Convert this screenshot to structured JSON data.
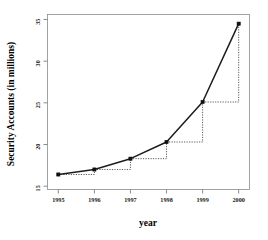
{
  "chart_data": {
    "type": "line",
    "title": "",
    "xlabel": "year",
    "ylabel": "Security Accounts (in millions)",
    "x": [
      1995,
      1996,
      1997,
      1998,
      1999,
      2000
    ],
    "categories": [
      "1995",
      "1996",
      "1997",
      "1998",
      "1999",
      "2000"
    ],
    "values": [
      16.4,
      17.0,
      18.3,
      20.3,
      25.1,
      34.5
    ],
    "series": [
      {
        "name": "Security Accounts",
        "values": [
          16.4,
          17.0,
          18.3,
          20.3,
          25.1,
          34.5
        ]
      }
    ],
    "xlim": [
      1994.7,
      2000.3
    ],
    "ylim": [
      14.6,
      35.6
    ],
    "ytick_labels": [
      "15",
      "20",
      "25",
      "30",
      "35"
    ],
    "ytick_values": [
      15,
      20,
      25,
      30,
      35
    ],
    "xtick_labels": [
      "1995",
      "1996",
      "1997",
      "1998",
      "1999",
      "2000"
    ],
    "xtick_values": [
      1995,
      1996,
      1997,
      1998,
      1999,
      2000
    ],
    "grid": false,
    "legend": false,
    "legend_position": "none",
    "annotations": [
      {
        "type": "step",
        "from_year": 1995,
        "to_year": 1996,
        "from_value": 16.4,
        "to_value": 17.0
      },
      {
        "type": "step",
        "from_year": 1996,
        "to_year": 1997,
        "from_value": 17.0,
        "to_value": 18.3
      },
      {
        "type": "step",
        "from_year": 1997,
        "to_year": 1998,
        "from_value": 18.3,
        "to_value": 20.3
      },
      {
        "type": "step",
        "from_year": 1998,
        "to_year": 1999,
        "from_value": 20.3,
        "to_value": 25.1
      },
      {
        "type": "step",
        "from_year": 1999,
        "to_year": 2000,
        "from_value": 25.1,
        "to_value": 34.5
      }
    ],
    "colors": {
      "line": "#1c1c1c",
      "point": "#111111",
      "step": "#4a4a4a",
      "frame": "#8a8a8a",
      "background": "#ffffff"
    }
  }
}
